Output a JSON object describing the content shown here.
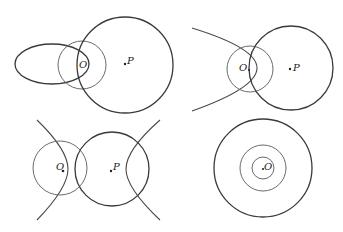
{
  "figure": {
    "panels": [
      {
        "id": "top-left",
        "description": "Ellipse, circle around O, and large circle centered at P",
        "labels": {
          "O": "O",
          "P": "P"
        }
      },
      {
        "id": "top-right",
        "description": "Hyperbola branch, circle around O, and large circle centered at P",
        "labels": {
          "O": "O",
          "P": "P"
        }
      },
      {
        "id": "bottom-left",
        "description": "Two hyperbola branches, circle around O, and circle centered at P",
        "labels": {
          "O": "O",
          "P": "P"
        }
      },
      {
        "id": "bottom-right",
        "description": "Three concentric circles centered at O",
        "labels": {
          "O": "O"
        }
      }
    ]
  }
}
